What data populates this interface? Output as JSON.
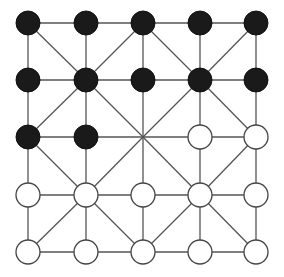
{
  "game": {
    "name": "Alquerque",
    "grid_size": 5,
    "columns_x": [
      28,
      86,
      143,
      200,
      256
    ],
    "rows_y": [
      23,
      80,
      137,
      195,
      252
    ],
    "piece_radius": 12,
    "colors": {
      "black": "#1a1a1a",
      "white": "#ffffff",
      "line": "#555555"
    },
    "board": [
      [
        "B",
        "B",
        "B",
        "B",
        "B"
      ],
      [
        "B",
        "B",
        "B",
        "B",
        "B"
      ],
      [
        "B",
        "B",
        "-",
        "W",
        "W"
      ],
      [
        "W",
        "W",
        "W",
        "W",
        "W"
      ],
      [
        "W",
        "W",
        "W",
        "W",
        "W"
      ]
    ]
  }
}
